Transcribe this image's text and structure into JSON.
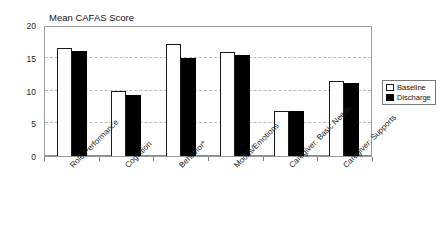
{
  "chart_data": {
    "type": "bar",
    "title": "Mean CAFAS Score",
    "xlabel": "",
    "ylabel": "",
    "ylim": [
      0,
      20
    ],
    "yticks": [
      0,
      5,
      10,
      15,
      20
    ],
    "grid": true,
    "legend_position": "right",
    "categories": [
      "Role Performance",
      "Cognition",
      "Behavior*",
      "Moods/Emotions",
      "Caregiver: Basic Needs",
      "Caregiver: Supports"
    ],
    "series": [
      {
        "name": "Baseline",
        "color": "#ffffff",
        "values": [
          16.5,
          10.0,
          17.1,
          15.9,
          6.8,
          11.5
        ]
      },
      {
        "name": "Discharge",
        "color": "#000000",
        "values": [
          16.0,
          9.3,
          14.9,
          15.4,
          6.9,
          11.2
        ]
      }
    ]
  },
  "legend": {
    "items": [
      {
        "label": "Baseline",
        "swatch": "hollow-square-icon"
      },
      {
        "label": "Discharge",
        "swatch": "filled-square-icon"
      }
    ]
  }
}
